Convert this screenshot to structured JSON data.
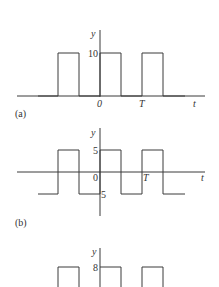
{
  "panels": [
    {
      "id": "a",
      "label": "(a)",
      "y_label": "y",
      "x_label": "t",
      "y_tick": "10",
      "x_ticks": [
        "0",
        "T"
      ],
      "waveform": "rectangular pulse train",
      "high": 10,
      "low": 0
    },
    {
      "id": "b",
      "label": "(b)",
      "y_label": "y",
      "x_label": "t",
      "y_ticks": [
        "5",
        "-5"
      ],
      "x_ticks": [
        "0",
        "T"
      ],
      "waveform": "square wave",
      "high": 5,
      "low": -5
    },
    {
      "id": "c",
      "y_label": "y",
      "y_tick": "8",
      "waveform": "rectangular pulse train",
      "high": 8
    }
  ],
  "text": {
    "a_y": "y",
    "a_ytick": "10",
    "a_x0": "0",
    "a_xT": "T",
    "a_t": "t",
    "a_label": "(a)",
    "b_y": "y",
    "b_ytick_pos": "5",
    "b_ytick_neg": "5",
    "b_x0": "0",
    "b_xT": "T",
    "b_t": "t",
    "b_label": "(b)",
    "c_y": "y",
    "c_ytick": "8"
  }
}
